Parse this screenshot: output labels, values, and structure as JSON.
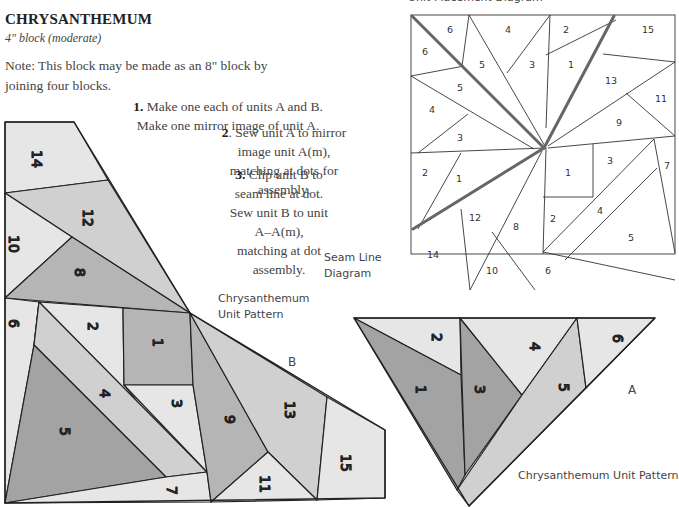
{
  "header": {
    "title": "CHRYSANTHEMUM",
    "subtitle": "4\" block (moderate)",
    "note": "Note: This block may be made as an 8\" block by joining four blocks."
  },
  "steps": [
    {
      "number": "1.",
      "text": "Make one each of units A and B. Make one mirror image of unit A."
    },
    {
      "number": "2",
      "text": ". Sew unit A to mirror image unit A(m), matching at dots for assembly."
    },
    {
      "number": "3.",
      "text": "Clip unit B to seam line at dot. Sew unit B to unit A–A(m), matching at dot assembly."
    }
  ],
  "labels": {
    "unit_placement_diagram": "Unit Placement Diagram",
    "seam_line_diagram_line1": "Seam Line",
    "seam_line_diagram_line2": "Diagram",
    "unit_b_pattern_line1": "Chrysanthemum",
    "unit_b_pattern_line2": "Unit Pattern",
    "unit_b_letter": "B",
    "unit_a_letter": "A",
    "unit_a_pattern": "Chrysanthemum Unit Pattern"
  },
  "colors": {
    "dark": "#a3a3a3",
    "medium": "#c2c2c2",
    "light": "#e3e3e3",
    "outline": "#222222",
    "seam_line": "#666666"
  },
  "unit_b_pieces": [
    "14",
    "12",
    "10",
    "8",
    "6",
    "2",
    "1",
    "4",
    "5",
    "3",
    "7",
    "9",
    "13",
    "11",
    "15"
  ],
  "unit_a_pieces": [
    "2",
    "1",
    "3",
    "4",
    "5",
    "6"
  ],
  "seam_diagram_pieces": [
    "6",
    "6",
    "4",
    "5",
    "3",
    "2",
    "1",
    "15",
    "5",
    "13",
    "11",
    "4",
    "9",
    "3",
    "2",
    "1",
    "1",
    "3",
    "7",
    "12",
    "8",
    "2",
    "4",
    "5",
    "14",
    "10",
    "6"
  ]
}
